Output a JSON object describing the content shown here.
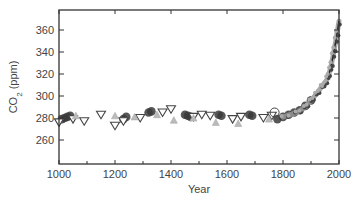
{
  "chart_data": {
    "type": "scatter",
    "title": "",
    "xlabel": "Year",
    "ylabel": "CO2 (ppm)",
    "xlim": [
      1000,
      2000
    ],
    "ylim": [
      250,
      375
    ],
    "x_ticks": [
      1000,
      1200,
      1400,
      1600,
      1800,
      2000
    ],
    "x_minor_ticks": [
      1100,
      1300,
      1500,
      1700,
      1900
    ],
    "y_ticks": [
      260,
      280,
      300,
      320,
      340,
      360
    ],
    "grid": false,
    "legend": null,
    "series": [
      {
        "name": "ice core A (filled circles)",
        "marker": "circle-filled",
        "color": "#333333",
        "points": [
          [
            1010,
            279
          ],
          [
            1020,
            280
          ],
          [
            1030,
            281
          ],
          [
            1040,
            282
          ],
          [
            1230,
            279
          ],
          [
            1240,
            281
          ],
          [
            1320,
            285
          ],
          [
            1330,
            286
          ],
          [
            1450,
            283
          ],
          [
            1460,
            282
          ],
          [
            1470,
            281
          ],
          [
            1570,
            283
          ],
          [
            1580,
            282
          ],
          [
            1680,
            283
          ],
          [
            1690,
            282
          ],
          [
            1780,
            279
          ],
          [
            1800,
            281
          ],
          [
            1820,
            283
          ],
          [
            1840,
            285
          ],
          [
            1860,
            287
          ],
          [
            1880,
            291
          ],
          [
            1900,
            296
          ]
        ]
      },
      {
        "name": "ice core B (open triangles)",
        "marker": "triangle-down-open",
        "color": "#444444",
        "points": [
          [
            1000,
            276
          ],
          [
            1050,
            279
          ],
          [
            1090,
            277
          ],
          [
            1150,
            283
          ],
          [
            1200,
            273
          ],
          [
            1230,
            277
          ],
          [
            1290,
            280
          ],
          [
            1370,
            285
          ],
          [
            1400,
            288
          ],
          [
            1480,
            281
          ],
          [
            1510,
            283
          ],
          [
            1540,
            282
          ],
          [
            1620,
            279
          ],
          [
            1650,
            281
          ],
          [
            1730,
            280
          ],
          [
            1760,
            282
          ]
        ]
      },
      {
        "name": "ice core C (gray triangles)",
        "marker": "triangle-up",
        "color": "#aaaaaa",
        "points": [
          [
            1060,
            282
          ],
          [
            1200,
            282
          ],
          [
            1270,
            281
          ],
          [
            1350,
            283
          ],
          [
            1410,
            278
          ],
          [
            1480,
            280
          ],
          [
            1560,
            276
          ],
          [
            1640,
            275
          ],
          [
            1750,
            279
          ]
        ]
      },
      {
        "name": "open circle",
        "marker": "circle-open",
        "color": "#444444",
        "points": [
          [
            1770,
            285
          ]
        ]
      },
      {
        "name": "firn / instrumental",
        "marker": "dense-gray",
        "color": "#888888",
        "points": [
          [
            1800,
            281
          ],
          [
            1850,
            285
          ],
          [
            1880,
            290
          ],
          [
            1900,
            296
          ],
          [
            1920,
            302
          ],
          [
            1940,
            309
          ],
          [
            1950,
            311
          ],
          [
            1960,
            317
          ],
          [
            1970,
            325
          ],
          [
            1980,
            338
          ],
          [
            1990,
            352
          ],
          [
            2000,
            368
          ]
        ]
      }
    ]
  }
}
